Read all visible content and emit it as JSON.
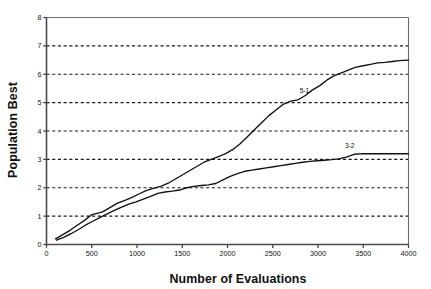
{
  "chart_data": {
    "type": "line",
    "title": "",
    "xlabel": "Number of Evaluations",
    "ylabel": "Population Best",
    "xlim": [
      0,
      4000
    ],
    "ylim": [
      0,
      8
    ],
    "xticks": [
      0,
      500,
      1000,
      1500,
      2000,
      2500,
      3000,
      3500,
      4000
    ],
    "xtick_labels": [
      "0",
      "500",
      "1000",
      "1500",
      "2000",
      "2500",
      "3000",
      "3500",
      "4000"
    ],
    "yticks": [
      0,
      1,
      2,
      3,
      4,
      5,
      6,
      7,
      8
    ],
    "ytick_labels": [
      "0",
      "1",
      "2",
      "3",
      "4",
      "5",
      "6",
      "7",
      "8"
    ],
    "grid": {
      "horizontal": true,
      "vertical": false,
      "style": "dashed",
      "levels": [
        1,
        2,
        3,
        4,
        5,
        6,
        7
      ]
    },
    "legend": {
      "position": "inline-annotation",
      "entries": [
        "5-1",
        "3-2"
      ]
    },
    "line_color": "#111111",
    "series": [
      {
        "name": "5-1",
        "label_x": 2850,
        "label_y": 5.35,
        "x": [
          100,
          180,
          260,
          340,
          420,
          500,
          560,
          620,
          700,
          780,
          860,
          940,
          1020,
          1100,
          1180,
          1260,
          1340,
          1420,
          1500,
          1580,
          1660,
          1740,
          1820,
          1900,
          1980,
          2060,
          2140,
          2220,
          2300,
          2380,
          2460,
          2540,
          2620,
          2700,
          2780,
          2860,
          2940,
          3020,
          3100,
          3180,
          3260,
          3340,
          3420,
          3500,
          3580,
          3660,
          3740,
          3820,
          3900,
          4000
        ],
        "y": [
          0.2,
          0.35,
          0.5,
          0.68,
          0.85,
          1.05,
          1.1,
          1.15,
          1.3,
          1.45,
          1.55,
          1.65,
          1.78,
          1.9,
          1.98,
          2.05,
          2.15,
          2.3,
          2.45,
          2.6,
          2.75,
          2.9,
          3.0,
          3.1,
          3.2,
          3.35,
          3.55,
          3.8,
          4.05,
          4.3,
          4.55,
          4.75,
          4.95,
          5.05,
          5.1,
          5.25,
          5.45,
          5.6,
          5.8,
          5.95,
          6.05,
          6.15,
          6.25,
          6.3,
          6.35,
          6.4,
          6.42,
          6.45,
          6.48,
          6.5
        ]
      },
      {
        "name": "3-2",
        "label_x": 3350,
        "label_y": 3.4,
        "x": [
          110,
          190,
          270,
          350,
          430,
          510,
          590,
          670,
          750,
          830,
          910,
          990,
          1070,
          1150,
          1230,
          1310,
          1390,
          1470,
          1550,
          1630,
          1710,
          1790,
          1870,
          1950,
          2030,
          2110,
          2190,
          2270,
          2350,
          2430,
          2510,
          2590,
          2670,
          2750,
          2830,
          2910,
          2990,
          3070,
          3150,
          3230,
          3310,
          3400,
          3500,
          3600,
          3700,
          3800,
          3900,
          4000
        ],
        "y": [
          0.15,
          0.25,
          0.38,
          0.52,
          0.68,
          0.82,
          0.95,
          1.08,
          1.2,
          1.32,
          1.42,
          1.5,
          1.6,
          1.7,
          1.8,
          1.85,
          1.88,
          1.92,
          2.0,
          2.05,
          2.08,
          2.1,
          2.15,
          2.28,
          2.4,
          2.5,
          2.58,
          2.62,
          2.66,
          2.7,
          2.74,
          2.78,
          2.82,
          2.86,
          2.9,
          2.93,
          2.95,
          2.97,
          2.99,
          3.02,
          3.08,
          3.18,
          3.2,
          3.2,
          3.2,
          3.2,
          3.2,
          3.2
        ]
      }
    ]
  }
}
